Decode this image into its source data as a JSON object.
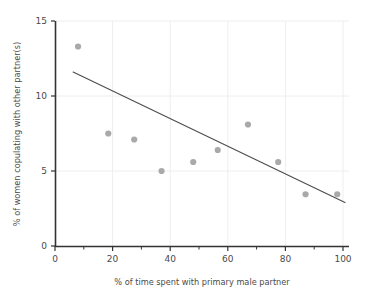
{
  "chart_data": {
    "type": "scatter",
    "title": "",
    "xlabel": "% of time spent with primary male partner",
    "ylabel": "% of women copulating with other partner(s)",
    "xlim": [
      0,
      100
    ],
    "ylim": [
      0,
      15
    ],
    "xticks": [
      0,
      20,
      40,
      60,
      80,
      100
    ],
    "xticklabels": [
      "0",
      "20",
      "40",
      "60",
      "80",
      "100"
    ],
    "xminorticks": [
      10,
      30,
      50,
      70,
      90
    ],
    "yticks": [
      0,
      5,
      10,
      15
    ],
    "yticklabels": [
      "0",
      "5",
      "10",
      "15"
    ],
    "grid": "y-major and x-major light gridlines",
    "legend": "none",
    "points": [
      {
        "x": 8.0,
        "y": 13.3
      },
      {
        "x": 18.5,
        "y": 7.5
      },
      {
        "x": 27.5,
        "y": 7.1
      },
      {
        "x": 37.0,
        "y": 5.0
      },
      {
        "x": 48.0,
        "y": 5.6
      },
      {
        "x": 56.5,
        "y": 6.4
      },
      {
        "x": 67.0,
        "y": 8.1
      },
      {
        "x": 77.5,
        "y": 5.6
      },
      {
        "x": 87.0,
        "y": 3.45
      },
      {
        "x": 98.0,
        "y": 3.45
      }
    ],
    "trendline": {
      "type": "linear-fit",
      "x_start": 6.3,
      "y_start": 11.6,
      "x_end": 100.7,
      "y_end": 2.9
    },
    "colors": {
      "marker": "#a9a9a9",
      "trendline": "#4d4d4d",
      "axis": "#333333",
      "grid": "#eeeeee",
      "text": "#4a4a4a",
      "background": "#ffffff"
    }
  }
}
